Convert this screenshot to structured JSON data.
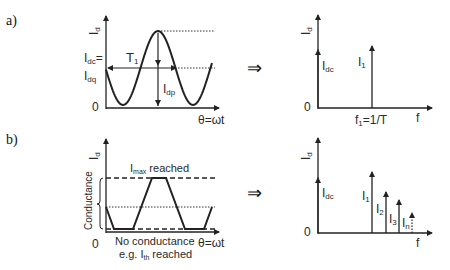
{
  "panel_a": {
    "tag": "a)",
    "waveform": {
      "y_axis_label": "I",
      "y_axis_sub": "d",
      "x_axis_label": "θ=ωt",
      "origin_label": "0",
      "idc_label": "I",
      "idc_sub": "dc",
      "idc_eq": "=",
      "idq_label": "I",
      "idq_sub": "dq",
      "period_label": "T",
      "period_sub": "1",
      "peak_label": "I",
      "peak_sub": "dp"
    },
    "arrow": "⇒",
    "spectrum": {
      "y_axis_label": "I",
      "y_axis_sub": "d",
      "x_axis_label": "f",
      "origin_label": "0",
      "dc_label": "I",
      "dc_sub": "dc",
      "h1_label": "I",
      "h1_sub": "1",
      "freq_label": "f",
      "freq_sub": "1",
      "freq_eq": "=1/T"
    }
  },
  "panel_b": {
    "tag": "b)",
    "waveform": {
      "y_axis_label": "I",
      "y_axis_sub": "d",
      "x_axis_label": "θ=ωt",
      "origin_label": "0",
      "max_label": "I",
      "max_sub": "max",
      "max_text": " reached",
      "conductance_label": "Conductance",
      "no_conductance_label": "No conductance",
      "threshold_prefix": "e.g. I",
      "threshold_sub": "th",
      "threshold_text": " reached"
    },
    "arrow": "⇒",
    "spectrum": {
      "y_axis_label": "I",
      "y_axis_sub": "d",
      "x_axis_label": "f",
      "origin_label": "0",
      "dc_label": "I",
      "dc_sub": "dc",
      "harmonics": [
        {
          "label": "I",
          "sub": "1"
        },
        {
          "label": "I",
          "sub": "2"
        },
        {
          "label": "I",
          "sub": "3"
        },
        {
          "label": "I",
          "sub": "n"
        }
      ]
    }
  }
}
